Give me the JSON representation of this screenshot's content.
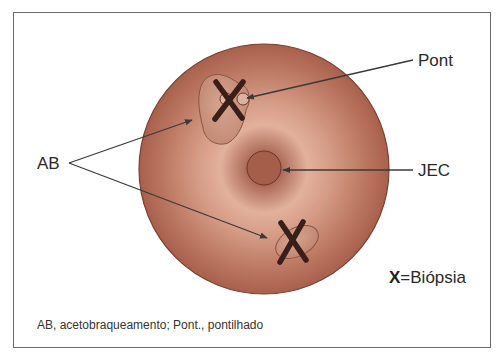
{
  "figure": {
    "labels": {
      "pont": "Pont",
      "jec": "JEC",
      "ab": "AB"
    },
    "legend": {
      "symbol": "X",
      "text": "=Biópsia"
    },
    "caption": "AB, acetobraqueamento; Pont., pontilhado"
  },
  "colors": {
    "cervix_base": "#b8705a",
    "cervix_light": "#e8b8a4",
    "cervix_dark": "#8a4a38",
    "lesion_fill": "#c99580",
    "os_fill": "#9a5844",
    "x_mark": "#3a1e18",
    "line": "#3a3a3a",
    "border": "#6a6a6a"
  }
}
